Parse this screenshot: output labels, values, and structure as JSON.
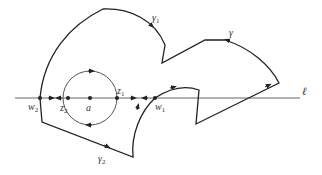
{
  "figure": {
    "colors": {
      "stroke": "#222222",
      "circle": "#555555",
      "line": "#666666",
      "background": "#ffffff"
    }
  },
  "labels": {
    "line_l": "ℓ",
    "gamma": "γ",
    "gamma1": "γ",
    "gamma1_sub": "1",
    "gamma2": "γ",
    "gamma2_sub": "2",
    "w2": "w",
    "w2_sub": "2",
    "z2": "z",
    "z2_sub": "2",
    "a": "a",
    "z1": "z",
    "z1_sub": "1",
    "w1": "w",
    "w1_sub": "1"
  },
  "points": {
    "w2": [
      40,
      98
    ],
    "z2": [
      68,
      98
    ],
    "a": [
      90,
      98
    ],
    "z1": [
      117,
      98
    ],
    "w1": [
      155,
      98
    ]
  },
  "circle": {
    "center": [
      90,
      98
    ],
    "radius": 27
  }
}
